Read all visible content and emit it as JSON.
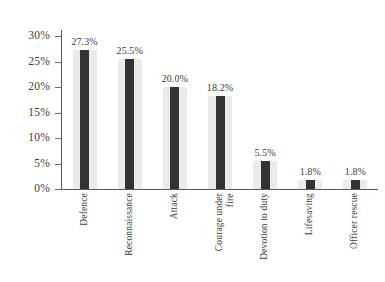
{
  "chart_data": {
    "type": "bar",
    "title": "",
    "subtitle": "",
    "xlabel": "",
    "ylabel": "",
    "categories": [
      "Defence",
      "Reconnaissance",
      "Attack",
      "Courage under\nfire",
      "Devotion to duty",
      "Lifesaving",
      "Officer rescue"
    ],
    "values": [
      27.3,
      25.5,
      20.0,
      18.2,
      5.5,
      1.8,
      1.8
    ],
    "value_labels": [
      "27.3%",
      "25.5%",
      "20.0%",
      "18.2%",
      "5.5%",
      "1.8%",
      "1.8%"
    ],
    "ylim": [
      0,
      30
    ],
    "ytick_values": [
      0,
      5,
      10,
      15,
      20,
      25,
      30
    ],
    "ytick_labels": [
      "0%",
      "5%",
      "10%",
      "15%",
      "20%",
      "25%",
      "30%"
    ],
    "grid": false,
    "legend": false,
    "legend_position": "none",
    "bar_color": "#333333",
    "bar_halo_color": "#eaeaea",
    "axis_color": "#585858",
    "text_color": "#3c3c3c",
    "background_color": "#ffffff",
    "xtick_rotation": 90
  }
}
